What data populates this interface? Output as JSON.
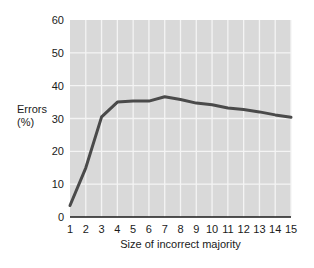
{
  "chart_data": {
    "type": "line",
    "title": "",
    "xlabel": "Size of incorrect majority",
    "ylabel": "Errors (%)",
    "ylabel_lines": [
      "Errors",
      "(%)"
    ],
    "x": [
      1,
      2,
      3,
      4,
      5,
      6,
      7,
      8,
      9,
      10,
      11,
      12,
      13,
      14,
      15
    ],
    "series": [
      {
        "name": "Errors",
        "values": [
          3.5,
          15,
          30.5,
          35,
          35.3,
          35.3,
          36.6,
          35.8,
          34.7,
          34.2,
          33.2,
          32.7,
          32.0,
          31.1,
          30.4
        ]
      }
    ],
    "xlim": [
      1,
      15
    ],
    "ylim": [
      0,
      60
    ],
    "yticks": [
      0,
      10,
      20,
      30,
      40,
      50,
      60
    ],
    "xticks": [
      1,
      2,
      3,
      4,
      5,
      6,
      7,
      8,
      9,
      10,
      11,
      12,
      13,
      14,
      15
    ],
    "grid": true,
    "legend": null
  },
  "colors": {
    "plot_background": "#d9d9d9",
    "grid": "#f4f4f4",
    "line": "#4a4a4a",
    "axis": "#1a1a1a",
    "text": "#1a1a1a"
  }
}
